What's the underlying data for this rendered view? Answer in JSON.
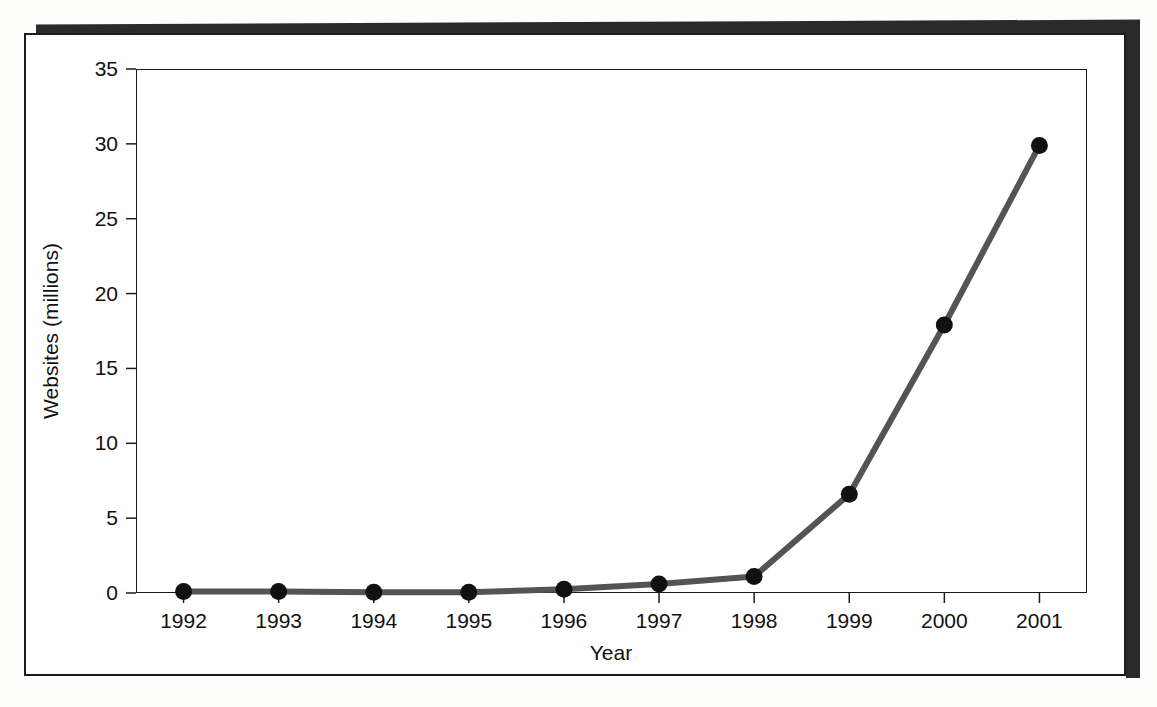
{
  "figure": {
    "alt_description": "Line chart of number of websites in millions by year",
    "frame_color": "#1b1b1b",
    "background_color": "#ffffff",
    "shadow_color": "#2a2a2a"
  },
  "chart_data": {
    "type": "line",
    "title": "",
    "subtitle": "",
    "xlabel": "Year",
    "ylabel": "Websites (millions)",
    "categories": [
      "1992",
      "1993",
      "1994",
      "1995",
      "1996",
      "1997",
      "1998",
      "1999",
      "2000",
      "2001"
    ],
    "x": [
      1992,
      1993,
      1994,
      1995,
      1996,
      1997,
      1998,
      1999,
      2000,
      2001
    ],
    "values": [
      0.1,
      0.1,
      0.05,
      0.05,
      0.25,
      0.6,
      1.1,
      6.6,
      17.9,
      29.9
    ],
    "series": [
      {
        "name": "Websites",
        "values": [
          0.1,
          0.1,
          0.05,
          0.05,
          0.25,
          0.6,
          1.1,
          6.6,
          17.9,
          29.9
        ],
        "line_color": "#545454",
        "marker_color": "#111111",
        "marker": "circle"
      }
    ],
    "ylim": [
      0,
      35
    ],
    "yticks": [
      0,
      5,
      10,
      15,
      20,
      25,
      30,
      35
    ],
    "ytick_labels": [
      "0",
      "5",
      "10",
      "15",
      "20",
      "25",
      "30",
      "35"
    ],
    "xtick_labels": [
      "1992",
      "1993",
      "1994",
      "1995",
      "1996",
      "1997",
      "1998",
      "1999",
      "2000",
      "2001"
    ],
    "grid": false,
    "legend": false,
    "legend_position": "none"
  }
}
